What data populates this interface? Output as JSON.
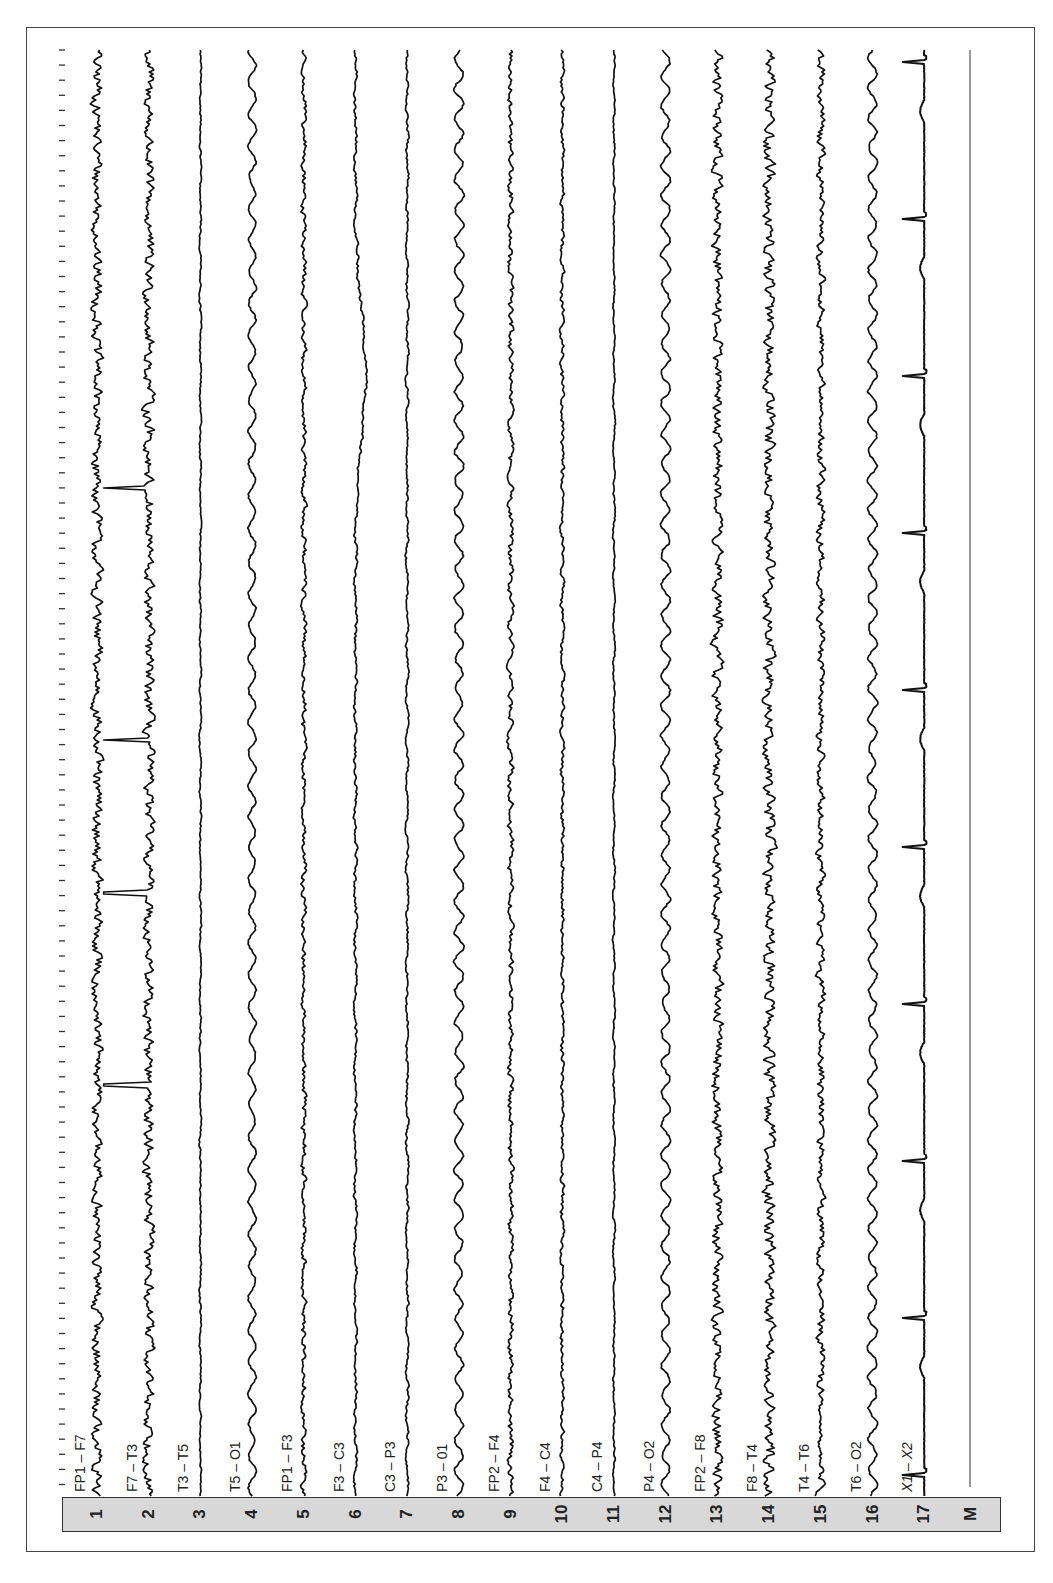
{
  "display": {
    "orientation": "rotated-90-ccw",
    "background": "#ffffff",
    "trace_color": "#111111",
    "channel_bar_color": "#d8d8d8",
    "marker_label": "M"
  },
  "chart_data": {
    "type": "line",
    "title": "",
    "subtitle": "",
    "xlabel": "",
    "ylabel": "",
    "time_ticks": {
      "count": 97,
      "spacing_px": 15.1,
      "start_px": 50,
      "end_px": 1493
    },
    "grid": false,
    "legend": "none",
    "channels": [
      {
        "index": 1,
        "number": "1",
        "label": "FP1 – F7",
        "activity": "fast/muscle artifact, high amplitude",
        "amp": 9,
        "noise": 1.0,
        "slow": 0.15,
        "period": 40
      },
      {
        "index": 2,
        "number": "2",
        "label": "F7 – T3",
        "activity": "fast activity with sharp transients",
        "amp": 9,
        "noise": 1.0,
        "slow": 0.15,
        "period": 40,
        "spikes_y": [
          488,
          740,
          893,
          1085
        ]
      },
      {
        "index": 3,
        "number": "3",
        "label": "T3 – T5",
        "activity": "low amplitude",
        "amp": 3,
        "noise": 0.5,
        "slow": 0.3,
        "period": 50
      },
      {
        "index": 4,
        "number": "4",
        "label": "T5 – O1",
        "activity": "rhythmic slow waves",
        "amp": 6,
        "noise": 0.3,
        "slow": 1.0,
        "period": 32
      },
      {
        "index": 5,
        "number": "5",
        "label": "FP1 – F3",
        "activity": "mixed fast",
        "amp": 5,
        "noise": 0.8,
        "slow": 0.3,
        "period": 40
      },
      {
        "index": 6,
        "number": "6",
        "label": "F3 – C3",
        "activity": "low amplitude with slow drift",
        "amp": 4,
        "noise": 0.6,
        "slow": 0.4,
        "period": 60,
        "drift": {
          "center": 375,
          "width": 90,
          "amp": 10
        }
      },
      {
        "index": 7,
        "number": "7",
        "label": "C3 – P3",
        "activity": "low amplitude",
        "amp": 3.5,
        "noise": 0.6,
        "slow": 0.4,
        "period": 45
      },
      {
        "index": 8,
        "number": "8",
        "label": "P3 – 01",
        "activity": "rhythmic slow waves (alpha/theta)",
        "amp": 7,
        "noise": 0.3,
        "slow": 1.0,
        "period": 30
      },
      {
        "index": 9,
        "number": "9",
        "label": "FP2 – F4",
        "activity": "mixed fast",
        "amp": 5,
        "noise": 0.9,
        "slow": 0.3,
        "period": 40
      },
      {
        "index": 10,
        "number": "10",
        "label": "F4 – C4",
        "activity": "low-moderate mixed",
        "amp": 4,
        "noise": 0.8,
        "slow": 0.3,
        "period": 40
      },
      {
        "index": 11,
        "number": "11",
        "label": "C4 – P4",
        "activity": "low amplitude",
        "amp": 3,
        "noise": 0.5,
        "slow": 0.4,
        "period": 45
      },
      {
        "index": 12,
        "number": "12",
        "label": "P4 – O2",
        "activity": "rhythmic slow waves",
        "amp": 7,
        "noise": 0.3,
        "slow": 1.0,
        "period": 30
      },
      {
        "index": 13,
        "number": "13",
        "label": "FP2 – F8",
        "activity": "fast/muscle artifact, high amplitude",
        "amp": 9,
        "noise": 1.0,
        "slow": 0.15,
        "period": 40
      },
      {
        "index": 14,
        "number": "14",
        "label": "F8 – T4",
        "activity": "fast/muscle artifact, very dense",
        "amp": 10,
        "noise": 1.0,
        "slow": 0.1,
        "period": 40
      },
      {
        "index": 15,
        "number": "15",
        "label": "T4 – T6",
        "activity": "fast mixed",
        "amp": 7,
        "noise": 0.9,
        "slow": 0.3,
        "period": 40
      },
      {
        "index": 16,
        "number": "16",
        "label": "T6 – O2",
        "activity": "rhythmic slow waves",
        "amp": 7,
        "noise": 0.3,
        "slow": 1.0,
        "period": 30
      },
      {
        "index": 17,
        "number": "17",
        "label": "X1 – X2",
        "activity": "ECG, regular R-waves",
        "type": "ecg",
        "amp": 12,
        "rr_px": 157,
        "first_beat_y": 60,
        "italic": true
      }
    ],
    "marker_channel": {
      "number": "M",
      "label": ""
    }
  }
}
